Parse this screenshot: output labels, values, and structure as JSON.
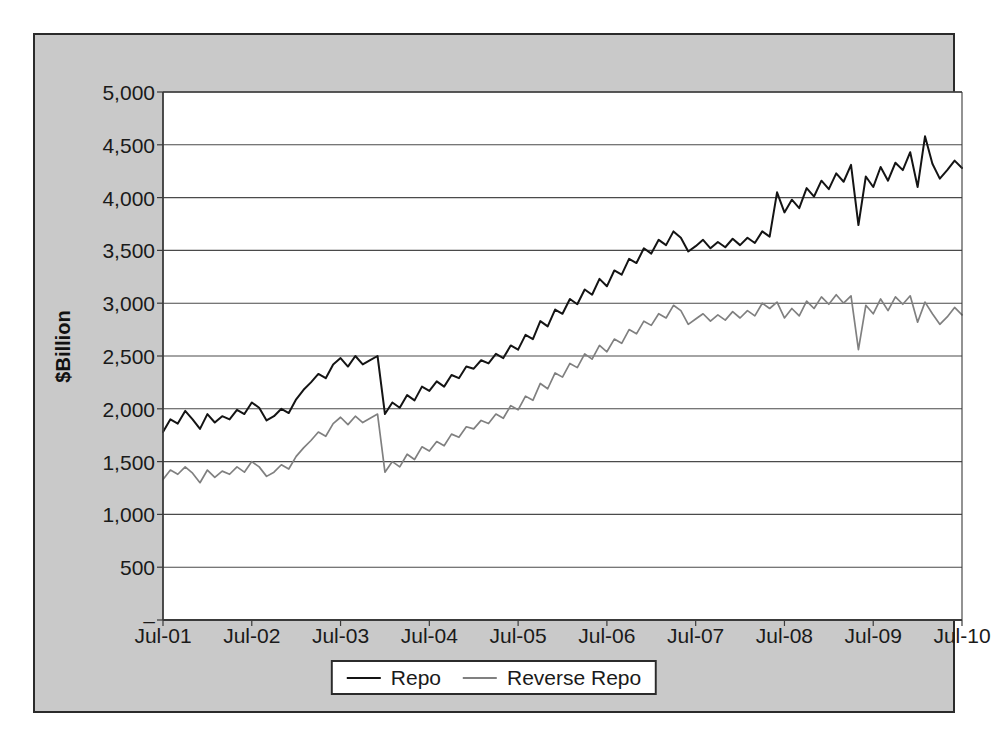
{
  "chart_data": {
    "type": "line",
    "title": "",
    "xlabel": "Date",
    "ylabel": "$Billion",
    "ylim": [
      0,
      5000
    ],
    "grid": true,
    "legend_position": "bottom",
    "ytick_labels": [
      "5,000",
      "4,500",
      "4,000",
      "3,500",
      "3,000",
      "2,500",
      "2,000",
      "1,500",
      "1,000",
      "500",
      "–"
    ],
    "ytick_values": [
      5000,
      4500,
      4000,
      3500,
      3000,
      2500,
      2000,
      1500,
      1000,
      500,
      0
    ],
    "xtick_labels": [
      "Jul-01",
      "Jul-02",
      "Jul-03",
      "Jul-04",
      "Jul-05",
      "Jul-06",
      "Jul-07",
      "Jul-08",
      "Jul-09",
      "Jul-10"
    ],
    "xtick_values": [
      "2001-07",
      "2002-07",
      "2003-07",
      "2004-07",
      "2005-07",
      "2006-07",
      "2007-07",
      "2008-07",
      "2009-07",
      "2010-07"
    ],
    "x": [
      "2001-07",
      "2001-08",
      "2001-09",
      "2001-10",
      "2001-11",
      "2001-12",
      "2002-01",
      "2002-02",
      "2002-03",
      "2002-04",
      "2002-05",
      "2002-06",
      "2002-07",
      "2002-08",
      "2002-09",
      "2002-10",
      "2002-11",
      "2002-12",
      "2003-01",
      "2003-02",
      "2003-03",
      "2003-04",
      "2003-05",
      "2003-06",
      "2003-07",
      "2003-08",
      "2003-09",
      "2003-10",
      "2003-11",
      "2003-12",
      "2004-01",
      "2004-02",
      "2004-03",
      "2004-04",
      "2004-05",
      "2004-06",
      "2004-07",
      "2004-08",
      "2004-09",
      "2004-10",
      "2004-11",
      "2004-12",
      "2005-01",
      "2005-02",
      "2005-03",
      "2005-04",
      "2005-05",
      "2005-06",
      "2005-07",
      "2005-08",
      "2005-09",
      "2005-10",
      "2005-11",
      "2005-12",
      "2006-01",
      "2006-02",
      "2006-03",
      "2006-04",
      "2006-05",
      "2006-06",
      "2006-07",
      "2006-08",
      "2006-09",
      "2006-10",
      "2006-11",
      "2006-12",
      "2007-01",
      "2007-02",
      "2007-03",
      "2007-04",
      "2007-05",
      "2007-06",
      "2007-07",
      "2007-08",
      "2007-09",
      "2007-10",
      "2007-11",
      "2007-12",
      "2008-01",
      "2008-02",
      "2008-03",
      "2008-04",
      "2008-05",
      "2008-06",
      "2008-07",
      "2008-08",
      "2008-09",
      "2008-10",
      "2008-11",
      "2008-12",
      "2009-01",
      "2009-02",
      "2009-03",
      "2009-04",
      "2009-05",
      "2009-06",
      "2009-07",
      "2009-08",
      "2009-09",
      "2009-10",
      "2009-11",
      "2009-12",
      "2010-01",
      "2010-02",
      "2010-03",
      "2010-04",
      "2010-05",
      "2010-06",
      "2010-07"
    ],
    "series": [
      {
        "name": "Repo",
        "color": "#141414",
        "values": [
          1780,
          1900,
          1860,
          1980,
          1900,
          1810,
          1950,
          1870,
          1930,
          1900,
          1990,
          1950,
          2060,
          2010,
          1890,
          1930,
          2000,
          1960,
          2090,
          2180,
          2250,
          2330,
          2290,
          2420,
          2480,
          2400,
          2500,
          2420,
          2460,
          2500,
          1950,
          2060,
          2010,
          2130,
          2080,
          2210,
          2170,
          2260,
          2210,
          2320,
          2290,
          2400,
          2380,
          2460,
          2430,
          2520,
          2480,
          2600,
          2560,
          2700,
          2660,
          2830,
          2780,
          2940,
          2900,
          3040,
          2990,
          3130,
          3080,
          3230,
          3160,
          3310,
          3270,
          3420,
          3380,
          3520,
          3470,
          3600,
          3550,
          3680,
          3620,
          3490,
          3540,
          3600,
          3520,
          3580,
          3530,
          3610,
          3550,
          3620,
          3570,
          3680,
          3630,
          4050,
          3860,
          3980,
          3900,
          4090,
          4010,
          4160,
          4080,
          4230,
          4150,
          4310,
          3740,
          4200,
          4100,
          4290,
          4160,
          4330,
          4260,
          4430,
          4100,
          4580,
          4320,
          4180,
          4260,
          4350,
          4280
        ],
        "values_full_note": "monthly approximations read from gridlines"
      },
      {
        "name": "Reverse Repo",
        "color": "#808080",
        "values": [
          1330,
          1420,
          1380,
          1450,
          1390,
          1300,
          1420,
          1350,
          1410,
          1380,
          1450,
          1400,
          1500,
          1450,
          1360,
          1400,
          1470,
          1430,
          1550,
          1630,
          1700,
          1780,
          1740,
          1860,
          1920,
          1850,
          1930,
          1870,
          1910,
          1950,
          1400,
          1500,
          1450,
          1570,
          1520,
          1640,
          1600,
          1690,
          1650,
          1760,
          1730,
          1830,
          1810,
          1890,
          1860,
          1950,
          1910,
          2030,
          1990,
          2120,
          2080,
          2240,
          2190,
          2340,
          2300,
          2430,
          2390,
          2520,
          2470,
          2600,
          2540,
          2660,
          2620,
          2750,
          2710,
          2830,
          2790,
          2900,
          2860,
          2980,
          2930,
          2800,
          2850,
          2900,
          2830,
          2890,
          2840,
          2920,
          2860,
          2930,
          2880,
          3000,
          2950,
          3010,
          2860,
          2950,
          2880,
          3020,
          2950,
          3060,
          2990,
          3080,
          3000,
          3070,
          2560,
          2980,
          2900,
          3040,
          2930,
          3060,
          2990,
          3070,
          2820,
          3010,
          2900,
          2800,
          2870,
          2960,
          2890
        ],
        "values_full_note": "monthly approximations read from gridlines"
      }
    ],
    "annotations": [
      {
        "label": "Repo peak",
        "value": 4600,
        "at": "2008-01"
      },
      {
        "label": "Reverse Repo peak",
        "value": 3080,
        "at": "2008-03"
      },
      {
        "label": "Post-crisis Repo trough",
        "value": 2400,
        "at": "2009-01"
      },
      {
        "label": "Post-crisis Reverse Repo trough",
        "value": 1550,
        "at": "2008-12"
      },
      {
        "label": "Repo series end",
        "value": 2750,
        "at": "2010-07"
      },
      {
        "label": "Reverse Repo series end",
        "value": 2150,
        "at": "2010-07"
      }
    ]
  },
  "legend": {
    "items": [
      {
        "label": "Repo",
        "color": "#141414"
      },
      {
        "label": "Reverse Repo",
        "color": "#808080"
      }
    ]
  }
}
